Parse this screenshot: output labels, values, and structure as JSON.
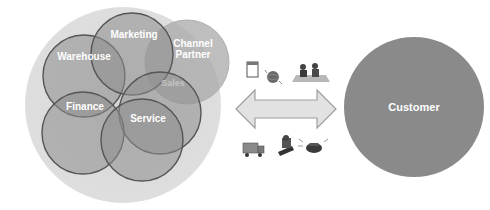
{
  "diagram": {
    "enterprise": {
      "background_color": "#dadada",
      "circle_fill": "#9a9a9a",
      "circle_stroke": "#555555",
      "departments": [
        {
          "label": "Warehouse",
          "cx": 84,
          "cy": 76,
          "r": 41,
          "tx": 84,
          "ty": 58
        },
        {
          "label": "Marketing",
          "cx": 132,
          "cy": 54,
          "r": 41,
          "tx": 137,
          "ty": 38
        },
        {
          "label": "Sales",
          "cx": 160,
          "cy": 113,
          "r": 41,
          "tx": 173,
          "ty": 87,
          "faded": true
        },
        {
          "label": "Finance",
          "cx": 83,
          "cy": 133,
          "r": 41,
          "tx": 85,
          "ty": 110
        },
        {
          "label": "Service",
          "cx": 142,
          "cy": 140,
          "r": 41,
          "tx": 148,
          "ty": 123
        }
      ],
      "partner": {
        "label_line1": "Channel",
        "label_line2": "Partner",
        "cx": 187,
        "cy": 62,
        "r": 42
      }
    },
    "exchange": {
      "arrow_color": "#e2e2e2",
      "arrow_stroke": "#9e9e9e",
      "top_icons": [
        "notepad-icon",
        "globe-icon",
        "meeting-icon"
      ],
      "bottom_icons": [
        "delivery-truck-icon",
        "mail-icon",
        "telephone-icon"
      ]
    },
    "customer": {
      "label": "Customer",
      "color": "#8a8a8a"
    }
  }
}
